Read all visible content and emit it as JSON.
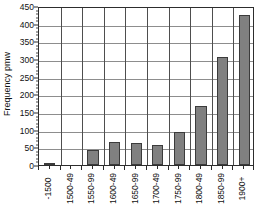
{
  "chart_data": {
    "type": "bar",
    "title": "",
    "xlabel": "",
    "ylabel": "Frequency pmw",
    "ylim": [
      0,
      450
    ],
    "ytick_step": 50,
    "yticks": [
      0,
      50,
      100,
      150,
      200,
      250,
      300,
      350,
      400,
      450
    ],
    "ytick_labels": [
      "0",
      "50",
      "100",
      "150",
      "200",
      "250",
      "300",
      "350",
      "400",
      "450"
    ],
    "grid": {
      "horizontal": true,
      "vertical": true
    },
    "legend": {
      "visible": false,
      "position": "none"
    },
    "categories": [
      "-1500",
      "1500-49",
      "1550-99",
      "1600-49",
      "1650-99",
      "1700-49",
      "1750-99",
      "1800-49",
      "1850-99",
      "1900+"
    ],
    "values": [
      2,
      0,
      42,
      64,
      62,
      57,
      93,
      168,
      305,
      425
    ],
    "bar_color": "#808080",
    "bar_border_color": "#3b3b3b",
    "axis_color": "#2d2d2d",
    "gridline_color": "#8d8d8d"
  }
}
